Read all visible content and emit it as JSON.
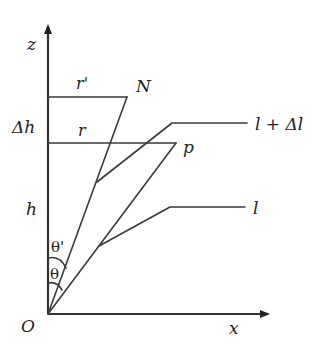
{
  "diagram": {
    "title": "",
    "axes": {
      "vertical_label": "z",
      "horizontal_label": "x",
      "origin_label": "O"
    },
    "labels": {
      "r_prime": "r'",
      "r": "r",
      "N": "N",
      "p": "p",
      "delta_h": "Δh",
      "h": "h",
      "l_plus_delta_l": "l + Δl",
      "l": "l",
      "theta_prime": "θ'",
      "theta": "θ"
    },
    "colors": {
      "line": "#3a3a3a",
      "text": "#222222",
      "background": "#ffffff"
    }
  }
}
